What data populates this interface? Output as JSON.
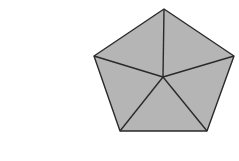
{
  "diagram": {
    "shape": "regular pentagon divided into 5 triangles from center",
    "fill_color": "#b5b5b5",
    "stroke_color": "#2a2a2a",
    "vertices": [
      [
        164,
        9
      ],
      [
        234,
        56
      ],
      [
        207,
        131
      ],
      [
        120,
        131
      ],
      [
        94,
        56
      ]
    ],
    "center": [
      163,
      77
    ]
  }
}
